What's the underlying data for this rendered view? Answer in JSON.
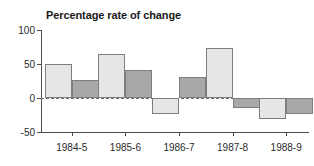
{
  "chart_data": {
    "type": "bar",
    "title": "Percentage rate of change",
    "xlabel": "",
    "ylabel": "",
    "ylim": [
      -50,
      100
    ],
    "yticks": [
      -50,
      0,
      50,
      100
    ],
    "ytick_labels": [
      "-50",
      "0",
      "50",
      "100"
    ],
    "grid": false,
    "zero_line": true,
    "legend": "none",
    "categories": [
      "1984-5",
      "1985-6",
      "1986-7",
      "1987-8",
      "1988-9"
    ],
    "series": [
      {
        "name": "series-a",
        "color": "#e6e6e6",
        "values": [
          50,
          65,
          -23,
          74,
          -31
        ]
      },
      {
        "name": "series-b",
        "color": "#a8a8a8",
        "values": [
          27,
          41,
          31,
          -14,
          -23
        ]
      }
    ]
  },
  "axis": {
    "line_color": "#4d4d4d",
    "zero_line_color": "#6e6e6e"
  }
}
